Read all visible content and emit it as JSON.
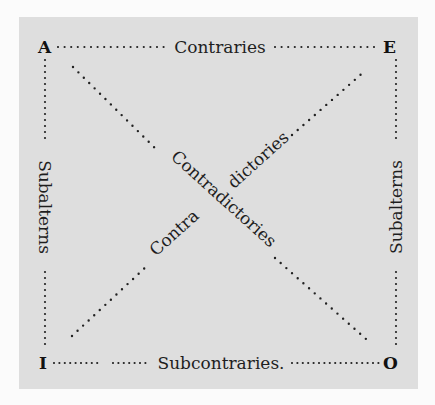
{
  "diagram": {
    "colors": {
      "background": "#fbfbfb",
      "panel": "#dedede",
      "ink": "#1e1e1e"
    },
    "corners": {
      "top_left": "A",
      "top_right": "E",
      "bottom_left": "I",
      "bottom_right": "O"
    },
    "edges": {
      "top": "Contraries",
      "bottom": "Subcontraries.",
      "left": "Subalterns",
      "right": "Subalterns"
    },
    "diagonals": {
      "descending": "Contradictories",
      "ascending_part1": "Contra",
      "ascending_part2": "dictories"
    }
  }
}
